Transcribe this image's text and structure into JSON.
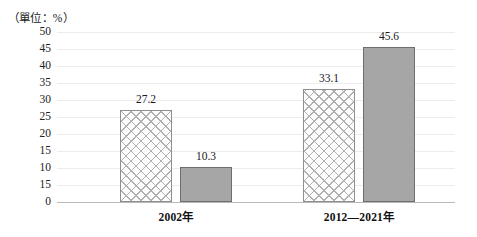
{
  "chart_data": {
    "type": "bar",
    "title": "（單位：%）",
    "xlabel": "",
    "ylabel": "",
    "ylim": [
      0,
      50
    ],
    "grid": true,
    "legend_position": "none",
    "categories": [
      "2002年",
      "2012—2021年"
    ],
    "y_ticks": [
      "50",
      "45",
      "40",
      "35",
      "30",
      "25",
      "20",
      "15",
      "10",
      "15",
      "0"
    ],
    "y_tick_values": [
      50,
      45,
      40,
      35,
      30,
      25,
      20,
      15,
      10,
      5,
      0
    ],
    "series": [
      {
        "name": "hatched",
        "style": "cross-hatch",
        "values": [
          27.2,
          33.1
        ],
        "labels": [
          "27.2",
          "33.1"
        ]
      },
      {
        "name": "solid",
        "style": "solid-gray",
        "values": [
          10.3,
          45.6
        ],
        "labels": [
          "10.3",
          "45.6"
        ]
      }
    ],
    "colors": {
      "hatch_fill": "#fdfdfd",
      "hatch_line": "#b0b0b0",
      "solid_fill": "#a6a6a6",
      "bar_border": "#8a8a8a",
      "gridline": "#ececec",
      "axis": "#b8b8b8",
      "text": "#1a1a1a"
    }
  }
}
